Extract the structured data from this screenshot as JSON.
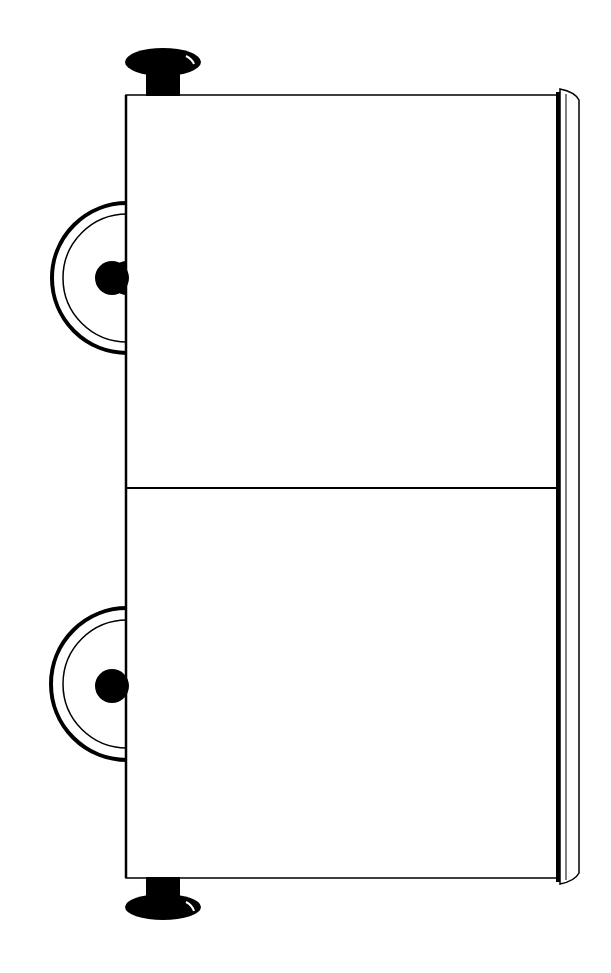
{
  "image": {
    "description": "Black-and-white line drawing of a two-compartment cart/wagon viewed from the side, rotated vertically",
    "colors": {
      "background": "#ffffff",
      "ink": "#000000"
    },
    "parts": {
      "body": "cart-body",
      "compartments": 2,
      "wheels": 2,
      "knobs": 2,
      "rail": "side-rail"
    }
  }
}
